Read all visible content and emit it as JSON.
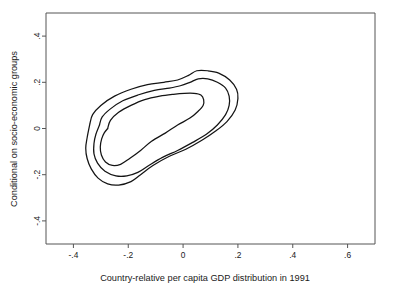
{
  "chart_data": {
    "type": "line",
    "subtype": "contour",
    "title": "",
    "xlabel": "Country-relative per capita GDP distribution in 1991",
    "ylabel": "Conditional on socio-economic groups",
    "xlim": [
      -0.5,
      0.7
    ],
    "ylim": [
      -0.5,
      0.5
    ],
    "xticks": [
      -0.4,
      -0.2,
      0,
      0.2,
      0.4,
      0.6
    ],
    "xticklabels": [
      "-.4",
      "-.2",
      "0",
      ".2",
      ".4",
      ".6"
    ],
    "yticks": [
      0.4,
      0.2,
      0,
      -0.2,
      -0.4
    ],
    "yticklabels": [
      ".4",
      ".2",
      "0",
      "-.2",
      "-.4"
    ],
    "grid": false,
    "legend": null,
    "n_contours": 3,
    "contour_color": "#141414",
    "frame_color": "#555555",
    "background": "#ffffff",
    "series": [
      {
        "name": "outer-contour",
        "level": 1,
        "points": [
          [
            -0.34,
            0.02
          ],
          [
            -0.33,
            0.06
          ],
          [
            -0.3,
            0.1
          ],
          [
            -0.25,
            0.14
          ],
          [
            -0.19,
            0.17
          ],
          [
            -0.13,
            0.19
          ],
          [
            -0.07,
            0.2
          ],
          [
            -0.02,
            0.21
          ],
          [
            0.02,
            0.23
          ],
          [
            0.05,
            0.25
          ],
          [
            0.09,
            0.25
          ],
          [
            0.13,
            0.24
          ],
          [
            0.17,
            0.21
          ],
          [
            0.195,
            0.17
          ],
          [
            0.2,
            0.13
          ],
          [
            0.19,
            0.08
          ],
          [
            0.16,
            0.03
          ],
          [
            0.12,
            -0.01
          ],
          [
            0.07,
            -0.05
          ],
          [
            0.01,
            -0.09
          ],
          [
            -0.05,
            -0.12
          ],
          [
            -0.11,
            -0.16
          ],
          [
            -0.155,
            -0.2
          ],
          [
            -0.19,
            -0.23
          ],
          [
            -0.235,
            -0.245
          ],
          [
            -0.275,
            -0.24
          ],
          [
            -0.31,
            -0.215
          ],
          [
            -0.335,
            -0.175
          ],
          [
            -0.35,
            -0.13
          ],
          [
            -0.355,
            -0.085
          ],
          [
            -0.35,
            -0.04
          ],
          [
            -0.34,
            0.02
          ]
        ]
      },
      {
        "name": "middle-contour",
        "level": 2,
        "points": [
          [
            -0.305,
            0.015
          ],
          [
            -0.295,
            0.05
          ],
          [
            -0.265,
            0.085
          ],
          [
            -0.22,
            0.12
          ],
          [
            -0.165,
            0.145
          ],
          [
            -0.105,
            0.165
          ],
          [
            -0.05,
            0.175
          ],
          [
            -0.01,
            0.185
          ],
          [
            0.025,
            0.2
          ],
          [
            0.055,
            0.215
          ],
          [
            0.09,
            0.215
          ],
          [
            0.125,
            0.2
          ],
          [
            0.155,
            0.175
          ],
          [
            0.168,
            0.14
          ],
          [
            0.168,
            0.1
          ],
          [
            0.155,
            0.06
          ],
          [
            0.125,
            0.015
          ],
          [
            0.085,
            -0.025
          ],
          [
            0.035,
            -0.06
          ],
          [
            -0.02,
            -0.095
          ],
          [
            -0.075,
            -0.125
          ],
          [
            -0.125,
            -0.16
          ],
          [
            -0.165,
            -0.19
          ],
          [
            -0.205,
            -0.205
          ],
          [
            -0.245,
            -0.205
          ],
          [
            -0.285,
            -0.185
          ],
          [
            -0.312,
            -0.15
          ],
          [
            -0.325,
            -0.11
          ],
          [
            -0.325,
            -0.065
          ],
          [
            -0.318,
            -0.025
          ],
          [
            -0.305,
            0.015
          ]
        ]
      },
      {
        "name": "inner-contour",
        "level": 3,
        "points": [
          [
            -0.275,
            0.0
          ],
          [
            -0.265,
            0.035
          ],
          [
            -0.235,
            0.07
          ],
          [
            -0.19,
            0.1
          ],
          [
            -0.14,
            0.125
          ],
          [
            -0.085,
            0.14
          ],
          [
            -0.035,
            0.148
          ],
          [
            0.005,
            0.152
          ],
          [
            0.04,
            0.152
          ],
          [
            0.065,
            0.145
          ],
          [
            0.075,
            0.125
          ],
          [
            0.073,
            0.1
          ],
          [
            0.055,
            0.075
          ],
          [
            0.025,
            0.045
          ],
          [
            -0.02,
            0.015
          ],
          [
            -0.065,
            -0.02
          ],
          [
            -0.115,
            -0.055
          ],
          [
            -0.155,
            -0.095
          ],
          [
            -0.195,
            -0.13
          ],
          [
            -0.228,
            -0.155
          ],
          [
            -0.258,
            -0.16
          ],
          [
            -0.283,
            -0.145
          ],
          [
            -0.298,
            -0.115
          ],
          [
            -0.302,
            -0.08
          ],
          [
            -0.297,
            -0.045
          ],
          [
            -0.287,
            -0.018
          ],
          [
            -0.275,
            0.0
          ]
        ]
      }
    ]
  },
  "figure": {
    "width": 393,
    "height": 296,
    "plot_left": 46,
    "plot_right": 375,
    "plot_top": 13,
    "plot_bottom": 244
  }
}
